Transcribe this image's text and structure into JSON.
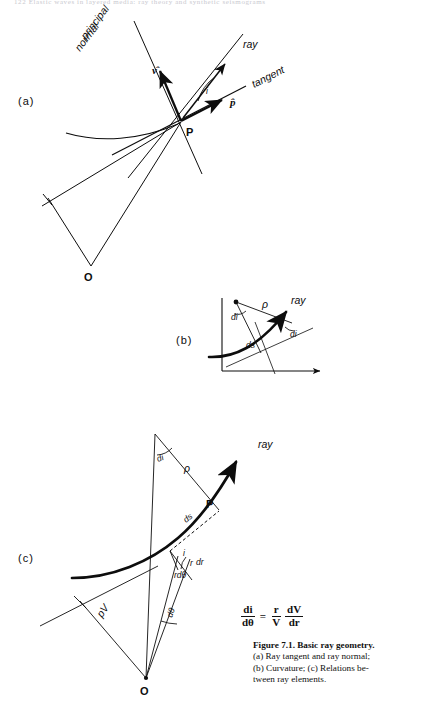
{
  "page": {
    "running_head": "122   Elastic waves in layered media: ray theory and synthetic seismograms"
  },
  "figure": {
    "caption_number": "Figure 7.1.",
    "caption_title": "Basic ray geometry.",
    "caption_line_a": "(a) Ray tangent and ray normal;",
    "caption_line_b": "(b) Curvature; (c) Relations be-",
    "caption_line_c": "tween ray elements.",
    "equation": {
      "lhs_num": "di",
      "lhs_den": "dθ",
      "relation": "=",
      "t1_num": "r",
      "t1_den": "V",
      "t2_num": "dV",
      "t2_den": "dr"
    }
  },
  "panel_a": {
    "label": "(a)",
    "labels": {
      "principal": "principal",
      "normal": "normal",
      "ray": "ray",
      "tangent": "tangent",
      "nu_hat": "ν̂",
      "p_hat": "p̂",
      "angle_i": "i",
      "point_p": "P",
      "point_o": "O"
    }
  },
  "panel_b": {
    "label": "(b)",
    "labels": {
      "rho": "ρ",
      "ray": "ray",
      "di_center": "di",
      "di_ray": "di",
      "ds": "ds"
    }
  },
  "panel_c": {
    "label": "(c)",
    "labels": {
      "di": "di",
      "rho": "ρ",
      "ray": "ray",
      "point_p": "P",
      "ds": "ds",
      "dr": "dr",
      "angle_i": "i",
      "rdtheta": "rdθ",
      "r": "r",
      "dtheta": "dθ",
      "pV": "pV",
      "point_o": "O"
    }
  },
  "colors": {
    "ink": "#0d0d0d",
    "paper": "#ffffff",
    "running_head": "#c9c9cf"
  }
}
